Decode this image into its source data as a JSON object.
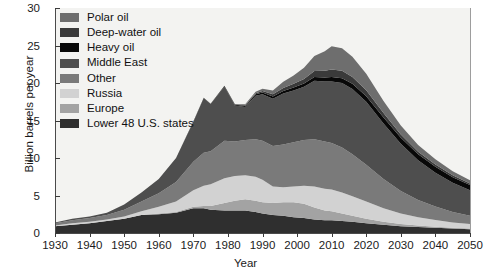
{
  "chart_data": {
    "type": "area",
    "stacked": true,
    "title": "",
    "xlabel": "Year",
    "ylabel": "Billion barrels per year",
    "xlim": [
      1930,
      2050
    ],
    "ylim": [
      0,
      30
    ],
    "xticks": [
      1930,
      1940,
      1950,
      1960,
      1970,
      1980,
      1990,
      2000,
      2010,
      2020,
      2030,
      2040,
      2050
    ],
    "yticks": [
      0,
      5,
      10,
      15,
      20,
      25,
      30
    ],
    "grid": false,
    "legend_position": "top-left",
    "legend_order": [
      "Polar oil",
      "Deep-water oil",
      "Heavy oil",
      "Middle East",
      "Other",
      "Russia",
      "Europe",
      "Lower 48 U.S. states"
    ],
    "colors": {
      "Polar oil": "#6e6e6e",
      "Deep-water oil": "#3a3a3a",
      "Heavy oil": "#080808",
      "Middle East": "#4e4e4e",
      "Other": "#7a7a7a",
      "Russia": "#d2d2d2",
      "Europe": "#a3a3a3",
      "Lower 48 U.S. states": "#2f2f2f",
      "plot_background": "#f3f3f1",
      "axis": "#4a4a4a",
      "text": "#1b1b1b"
    },
    "x": [
      1930,
      1935,
      1940,
      1945,
      1950,
      1955,
      1960,
      1965,
      1970,
      1973,
      1975,
      1979,
      1982,
      1985,
      1988,
      1990,
      1993,
      1996,
      1999,
      2002,
      2005,
      2008,
      2010,
      2013,
      2016,
      2020,
      2025,
      2030,
      2035,
      2040,
      2045,
      2050
    ],
    "series": [
      {
        "name": "Lower 48 U.S. states",
        "values": [
          0.9,
          1.1,
          1.3,
          1.6,
          1.9,
          2.4,
          2.5,
          2.7,
          3.3,
          3.3,
          3.1,
          3.0,
          3.0,
          3.0,
          2.8,
          2.6,
          2.4,
          2.3,
          2.1,
          2.0,
          1.8,
          1.7,
          1.7,
          1.6,
          1.5,
          1.3,
          1.1,
          0.9,
          0.8,
          0.7,
          0.6,
          0.5
        ]
      },
      {
        "name": "Europe",
        "values": [
          0.0,
          0.0,
          0.0,
          0.0,
          0.0,
          0.0,
          0.1,
          0.1,
          0.2,
          0.3,
          0.5,
          1.0,
          1.3,
          1.5,
          1.5,
          1.5,
          1.6,
          1.8,
          2.0,
          1.9,
          1.6,
          1.3,
          1.2,
          1.0,
          0.8,
          0.6,
          0.4,
          0.3,
          0.2,
          0.15,
          0.1,
          0.1
        ]
      },
      {
        "name": "Russia",
        "values": [
          0.1,
          0.2,
          0.2,
          0.2,
          0.3,
          0.5,
          0.9,
          1.4,
          2.2,
          2.7,
          2.9,
          3.3,
          3.3,
          3.2,
          3.2,
          3.0,
          2.2,
          2.0,
          2.1,
          2.4,
          2.8,
          2.9,
          2.9,
          2.8,
          2.6,
          2.3,
          1.8,
          1.4,
          1.1,
          0.9,
          0.7,
          0.6
        ]
      },
      {
        "name": "Other",
        "values": [
          0.3,
          0.4,
          0.5,
          0.6,
          0.9,
          1.3,
          1.8,
          2.6,
          3.8,
          4.4,
          4.4,
          5.0,
          4.6,
          4.7,
          5.0,
          5.2,
          5.4,
          5.7,
          5.9,
          6.1,
          6.3,
          6.3,
          6.2,
          6.0,
          5.6,
          4.9,
          3.9,
          3.0,
          2.3,
          1.8,
          1.4,
          1.1
        ]
      },
      {
        "name": "Middle East",
        "values": [
          0.1,
          0.2,
          0.2,
          0.3,
          0.7,
          1.2,
          1.9,
          3.2,
          5.3,
          7.3,
          6.3,
          7.2,
          4.8,
          4.4,
          5.8,
          6.2,
          6.3,
          6.8,
          6.9,
          7.1,
          7.8,
          8.0,
          8.2,
          8.6,
          8.7,
          8.4,
          7.4,
          6.3,
          5.3,
          4.5,
          3.9,
          3.4
        ]
      },
      {
        "name": "Heavy oil",
        "values": [
          0.0,
          0.0,
          0.0,
          0.0,
          0.0,
          0.0,
          0.0,
          0.0,
          0.05,
          0.05,
          0.05,
          0.1,
          0.1,
          0.15,
          0.2,
          0.25,
          0.3,
          0.35,
          0.4,
          0.45,
          0.5,
          0.55,
          0.6,
          0.65,
          0.7,
          0.75,
          0.8,
          0.8,
          0.8,
          0.8,
          0.75,
          0.7
        ]
      },
      {
        "name": "Deep-water oil",
        "values": [
          0.0,
          0.0,
          0.0,
          0.0,
          0.0,
          0.0,
          0.0,
          0.0,
          0.0,
          0.0,
          0.0,
          0.05,
          0.05,
          0.1,
          0.15,
          0.2,
          0.3,
          0.4,
          0.5,
          0.6,
          0.8,
          0.9,
          1.0,
          1.0,
          0.9,
          0.8,
          0.6,
          0.45,
          0.35,
          0.3,
          0.25,
          0.2
        ]
      },
      {
        "name": "Polar oil",
        "values": [
          0.0,
          0.0,
          0.0,
          0.0,
          0.0,
          0.0,
          0.0,
          0.0,
          0.0,
          0.0,
          0.0,
          0.0,
          0.05,
          0.1,
          0.2,
          0.3,
          0.5,
          0.8,
          1.1,
          1.5,
          2.0,
          2.6,
          3.1,
          3.0,
          2.7,
          2.2,
          1.6,
          1.2,
          0.9,
          0.7,
          0.55,
          0.45
        ]
      }
    ]
  },
  "legend": {
    "items": [
      {
        "label": "Polar oil",
        "color": "#6e6e6e"
      },
      {
        "label": "Deep-water oil",
        "color": "#3a3a3a"
      },
      {
        "label": "Heavy oil",
        "color": "#080808"
      },
      {
        "label": "Middle East",
        "color": "#4e4e4e"
      },
      {
        "label": "Other",
        "color": "#7a7a7a"
      },
      {
        "label": "Russia",
        "color": "#d2d2d2"
      },
      {
        "label": "Europe",
        "color": "#a3a3a3"
      },
      {
        "label": "Lower 48 U.S. states",
        "color": "#2f2f2f"
      }
    ]
  },
  "axes": {
    "y_title": "Billion barrels per year",
    "x_title": "Year",
    "y_ticks": [
      "0",
      "5",
      "10",
      "15",
      "20",
      "25",
      "30"
    ],
    "x_ticks": [
      "1930",
      "1940",
      "1950",
      "1960",
      "1970",
      "1980",
      "1990",
      "2000",
      "2010",
      "2020",
      "2030",
      "2040",
      "2050"
    ]
  }
}
